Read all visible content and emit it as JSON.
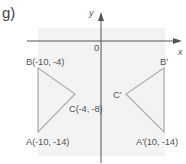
{
  "part_label": "g)",
  "axes": {
    "x_label": "x",
    "y_label": "y",
    "origin_label": "0"
  },
  "colors": {
    "background_panel": "#f2f2f2",
    "axis": "#555555",
    "triangle": "#b0b0b0"
  },
  "triangle_original": {
    "A": "A(-10, -14)",
    "B": "B(-10, -4)",
    "C": "C(-4, -8)"
  },
  "triangle_image": {
    "A": "A'(10, -14)",
    "B": "B'",
    "C": "C'"
  }
}
